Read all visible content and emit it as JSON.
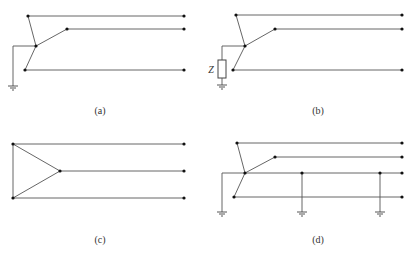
{
  "figure": {
    "panels": [
      {
        "id": "a",
        "caption": "(a)",
        "description": "Wye-connected three-phase with neutral solidly grounded"
      },
      {
        "id": "b",
        "caption": "(b)",
        "description": "Wye-connected three-phase with neutral grounded through impedance Z",
        "impedance_label": "Z"
      },
      {
        "id": "c",
        "caption": "(c)",
        "description": "Delta-connected three-phase, ungrounded"
      },
      {
        "id": "d",
        "caption": "(d)",
        "description": "Wye-connected three-phase four-wire with multi-grounded neutral"
      }
    ]
  },
  "colors": {
    "wire": "#555555",
    "node": "#111111",
    "text": "#333333",
    "background": "#ffffff"
  }
}
